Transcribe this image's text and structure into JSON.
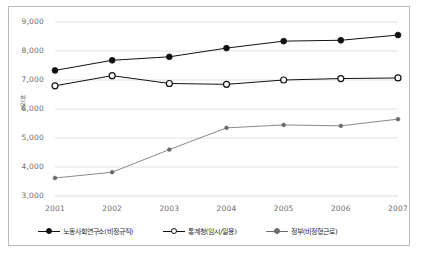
{
  "chart_data": {
    "type": "line",
    "title": "",
    "xlabel": "",
    "ylabel": "천명",
    "categories": [
      "2001",
      "2002",
      "2003",
      "2004",
      "2005",
      "2006",
      "2007"
    ],
    "ylim": [
      3000,
      9000
    ],
    "ytick_values": [
      3000,
      4000,
      5000,
      6000,
      7000,
      8000,
      9000
    ],
    "ytick_labels": [
      "3,000",
      "4,000",
      "5,000",
      "6,000",
      "7,000",
      "8,000",
      "9,000"
    ],
    "grid": "horizontal",
    "legend_position": "bottom",
    "series": [
      {
        "name": "노동사회연구소(비정규직)",
        "marker": "filled-circle",
        "color": "#111111",
        "values": [
          7330,
          7680,
          7800,
          8100,
          8340,
          8370,
          8550
        ]
      },
      {
        "name": "통계청(임시/일용)",
        "marker": "hollow-circle",
        "color": "#111111",
        "values": [
          6800,
          7150,
          6880,
          6850,
          7000,
          7050,
          7070
        ]
      },
      {
        "name": "정부(비정형근로)",
        "marker": "small-filled-circle",
        "color": "#6b6b6b",
        "values": [
          3620,
          3820,
          4600,
          5350,
          5450,
          5420,
          5650
        ]
      }
    ]
  },
  "axis": {
    "ylabel_chars": [
      "천",
      "명"
    ]
  }
}
